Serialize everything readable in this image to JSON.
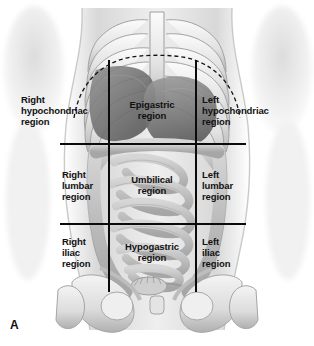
{
  "figure": {
    "panel_letter": "A",
    "view": "anterior torso"
  },
  "colors": {
    "grid_line": "#0b0b0b",
    "costal_margin_dash": "#111111",
    "label_text": "#111111",
    "background": "#ffffff",
    "skin_light": "#e9e9e9",
    "bone_light": "#f2f2f2",
    "bone_shadow": "#9a9a9a",
    "organ_mid": "#8c8c8c",
    "organ_dark": "#5e5e5e",
    "intestine": "#bdbdbd"
  },
  "grid": {
    "vertical_lines": [
      {
        "name": "right-midclavicular-line",
        "x": 109,
        "y_top": 60,
        "y_bottom": 292
      },
      {
        "name": "left-midclavicular-line",
        "x": 196,
        "y_top": 60,
        "y_bottom": 292
      }
    ],
    "horizontal_lines": [
      {
        "name": "subcostal-line",
        "y": 144,
        "x_left": 60,
        "x_right": 246
      },
      {
        "name": "intertubercular-line",
        "y": 224,
        "x_left": 60,
        "x_right": 246
      }
    ]
  },
  "regions": [
    {
      "id": "right-hypochondriac",
      "text": "Right\nhypochondriac\nregion",
      "align": "left",
      "x": 21,
      "y": 94,
      "row": 1,
      "col": 1
    },
    {
      "id": "epigastric",
      "text": "Epigastric\nregion",
      "align": "center",
      "x": 113,
      "y": 99,
      "row": 1,
      "col": 2
    },
    {
      "id": "left-hypochondriac",
      "text": "Left\nhypochondriac\nregion",
      "align": "left",
      "x": 202,
      "y": 94,
      "row": 1,
      "col": 3
    },
    {
      "id": "right-lumbar",
      "text": "Right\nlumbar\nregion",
      "align": "left",
      "x": 62,
      "y": 169,
      "row": 2,
      "col": 1
    },
    {
      "id": "umbilical",
      "text": "Umbilical\nregion",
      "align": "center",
      "x": 113,
      "y": 174,
      "row": 2,
      "col": 2
    },
    {
      "id": "left-lumbar",
      "text": "Left\nlumbar\nregion",
      "align": "left",
      "x": 202,
      "y": 169,
      "row": 2,
      "col": 3
    },
    {
      "id": "right-iliac",
      "text": "Right\niliac\nregion",
      "align": "left",
      "x": 62,
      "y": 236,
      "row": 3,
      "col": 1
    },
    {
      "id": "hypogastric",
      "text": "Hypogastric\nregion",
      "align": "center",
      "x": 113,
      "y": 241,
      "row": 3,
      "col": 2
    },
    {
      "id": "left-iliac",
      "text": "Left\niliac\nregion",
      "align": "left",
      "x": 202,
      "y": 236,
      "row": 3,
      "col": 3
    }
  ],
  "anatomy": {
    "structures": [
      "rib-cage",
      "sternum",
      "xiphoid-process",
      "costal-margin",
      "liver",
      "stomach",
      "small-intestine",
      "large-intestine",
      "pelvis",
      "ilium",
      "pubic-symphysis",
      "femur-head"
    ]
  }
}
